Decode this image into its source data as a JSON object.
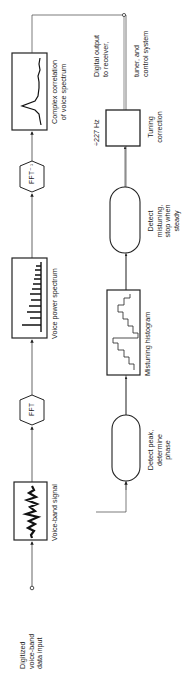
{
  "diagram": {
    "orientation": "rotated-90-ccw",
    "nodes": {
      "input": {
        "label_lines": [
          "Digitized",
          "voice-band",
          "data input"
        ]
      },
      "voice_band": {
        "label": "Voice-band signal"
      },
      "fft": {
        "label": "FFT"
      },
      "power_spectrum": {
        "label": "Voice power spectrum"
      },
      "ifft": {
        "label": "FFT⁻¹"
      },
      "correlation": {
        "label_lines": [
          "Complex correlation",
          "of voice spectrum"
        ]
      },
      "detect_peak": {
        "label_lines": [
          "Detect peak,",
          "determine",
          "phase"
        ]
      },
      "histogram": {
        "label": "Mistuning histogram"
      },
      "detect_mistuning": {
        "label_lines": [
          "Detect",
          "mistuning,",
          "stop when",
          "steady"
        ]
      },
      "tuning": {
        "top_label": "÷227 Hz",
        "label_lines": [
          "Tuning",
          "correction"
        ]
      },
      "output": {
        "label_lines": [
          "Digital output",
          "to receiver,",
          "tuner, and",
          "control system"
        ]
      }
    },
    "edges": [
      [
        "input",
        "voice_band"
      ],
      [
        "voice_band",
        "fft"
      ],
      [
        "fft",
        "power_spectrum"
      ],
      [
        "power_spectrum",
        "ifft"
      ],
      [
        "ifft",
        "correlation"
      ],
      [
        "correlation",
        "detect_peak"
      ],
      [
        "detect_peak",
        "histogram"
      ],
      [
        "histogram",
        "detect_mistuning"
      ],
      [
        "detect_mistuning",
        "tuning"
      ],
      [
        "tuning",
        "output"
      ]
    ],
    "colors": {
      "line": "#222222",
      "background": "#ffffff"
    }
  }
}
